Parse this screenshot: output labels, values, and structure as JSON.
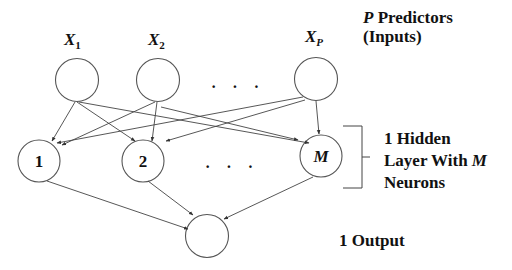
{
  "diagram": {
    "input_layer": {
      "nodes": [
        {
          "var": "X",
          "sub": "1"
        },
        {
          "var": "X",
          "sub": "2"
        },
        {
          "var": "X",
          "sub": "P"
        }
      ],
      "ellipsis": "· · ·",
      "caption_var": "P",
      "caption_line1": " Predictors",
      "caption_line2": "(Inputs)"
    },
    "hidden_layer": {
      "nodes": [
        "1",
        "2",
        "M"
      ],
      "ellipsis": "· · ·",
      "caption_line1": "1 Hidden",
      "caption_line2": "Layer With ",
      "caption_var": "M",
      "caption_line3": "Neurons"
    },
    "output_layer": {
      "caption": "1 Output"
    },
    "colors": {
      "stroke": "#555555",
      "text": "#111111",
      "background": "#ffffff"
    }
  }
}
